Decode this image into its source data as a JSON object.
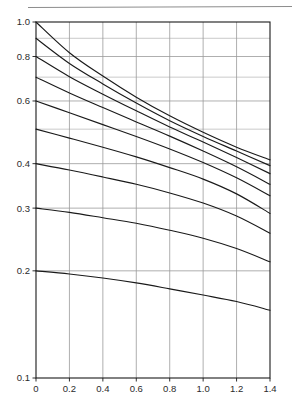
{
  "figure": {
    "caption": "",
    "rule_label": "page-rule"
  },
  "chart_data": {
    "type": "line",
    "title": "",
    "subtitle": "",
    "xlabel": "",
    "ylabel": "",
    "xlim": [
      0,
      1.4
    ],
    "ylim": [
      0.1,
      1.0
    ],
    "yscale": "log",
    "xscale": "linear",
    "grid": true,
    "legend": "none",
    "annotations": [],
    "x_ticks": [
      0,
      0.2,
      0.4,
      0.6,
      0.8,
      1.0,
      1.2,
      1.4
    ],
    "x_tick_labels": [
      "0",
      "0.2",
      "0.4",
      "0.6",
      "0.8",
      "1.0",
      "1.2",
      "1.4"
    ],
    "y_ticks": [
      1.0,
      0.8,
      0.6,
      0.4,
      0.3,
      0.2,
      0.1
    ],
    "y_tick_labels": [
      "1.0",
      "0.8",
      "0.6",
      "0.4",
      "0.3",
      "0.2",
      "0.1"
    ],
    "y_minor_gridlines": [
      0.9,
      0.7,
      0.5
    ],
    "x": [
      0,
      0.2,
      0.4,
      0.6,
      0.8,
      1.0,
      1.2,
      1.4
    ],
    "series": [
      {
        "name": "curve-1.0",
        "start": 1.0,
        "end": 0.41,
        "values": [
          1.0,
          0.82,
          0.705,
          0.615,
          0.545,
          0.49,
          0.445,
          0.41
        ]
      },
      {
        "name": "curve-0.9",
        "start": 0.9,
        "end": 0.395,
        "values": [
          0.9,
          0.765,
          0.67,
          0.592,
          0.528,
          0.477,
          0.434,
          0.395
        ]
      },
      {
        "name": "curve-0.8",
        "start": 0.8,
        "end": 0.375,
        "values": [
          0.8,
          0.702,
          0.627,
          0.563,
          0.507,
          0.46,
          0.416,
          0.375
        ]
      },
      {
        "name": "curve-0.7",
        "start": 0.7,
        "end": 0.35,
        "values": [
          0.7,
          0.632,
          0.575,
          0.524,
          0.478,
          0.434,
          0.392,
          0.35
        ]
      },
      {
        "name": "curve-0.6",
        "start": 0.6,
        "end": 0.325,
        "values": [
          0.6,
          0.556,
          0.515,
          0.477,
          0.44,
          0.403,
          0.365,
          0.325
        ]
      },
      {
        "name": "curve-0.5",
        "start": 0.5,
        "end": 0.29,
        "values": [
          0.5,
          0.472,
          0.445,
          0.418,
          0.39,
          0.362,
          0.329,
          0.29
        ]
      },
      {
        "name": "curve-0.4",
        "start": 0.4,
        "end": 0.255,
        "values": [
          0.4,
          0.384,
          0.367,
          0.35,
          0.331,
          0.31,
          0.285,
          0.255
        ]
      },
      {
        "name": "curve-0.3",
        "start": 0.3,
        "end": 0.212,
        "values": [
          0.3,
          0.292,
          0.282,
          0.272,
          0.26,
          0.247,
          0.231,
          0.212
        ]
      },
      {
        "name": "curve-0.2",
        "start": 0.2,
        "end": 0.155,
        "values": [
          0.2,
          0.196,
          0.191,
          0.185,
          0.178,
          0.171,
          0.164,
          0.155
        ]
      }
    ]
  },
  "style": {
    "curve_color": "#1a1a1a",
    "grid_color": "#9a9a9a",
    "minor_grid_color": "#bcbcbc",
    "axis_color": "#1a1a1a",
    "tick_text_color": "#2b2b2b",
    "background": "#ffffff"
  }
}
